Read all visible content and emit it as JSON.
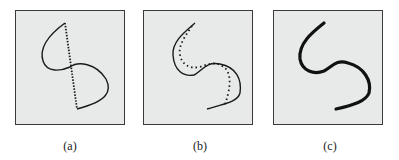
{
  "panels": [
    {
      "label": "(a)",
      "description": "Loop-shaped solid curve with a straight dotted chord connecting its endpoints",
      "curves": [
        {
          "style": "solid",
          "path": "M 49 12 C 38 20, 22 34, 27 50 C 31 62, 45 60, 54 56 C 62 50, 80 52, 90 68 C 96 80, 92 90, 61 98"
        },
        {
          "style": "dotted",
          "path": "M 49 12 L 61 98"
        }
      ]
    },
    {
      "label": "(b)",
      "description": "S-shaped solid curve with an inner dotted approximation curve",
      "curves": [
        {
          "style": "solid",
          "path": "M 51 12 C 42 20, 28 30, 29 44 C 30 60, 40 66, 50 64 C 58 60, 62 50, 76 53 C 92 56, 98 68, 96 82 C 94 90, 84 92, 63 98"
        },
        {
          "style": "dotted",
          "path": "M 48 15 C 42 24, 34 34, 36 44 C 38 54, 46 58, 56 56 C 66 52, 74 50, 82 58 C 88 66, 86 80, 80 96"
        }
      ]
    },
    {
      "label": "(c)",
      "description": "Thick smooth S-shaped curve (result)",
      "curves": [
        {
          "style": "thick",
          "path": "M 50 12 C 40 20, 24 32, 26 48 C 28 60, 40 64, 50 60 C 58 56, 62 48, 74 52 C 90 56, 98 70, 95 82 C 92 90, 80 94, 62 98"
        }
      ]
    }
  ],
  "colors": {
    "panel_background": "#e8e9e9",
    "panel_border": "#3a3a3a",
    "stroke": "#1a1a1a"
  }
}
